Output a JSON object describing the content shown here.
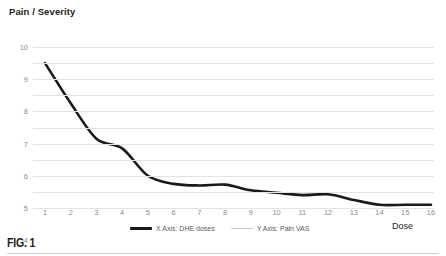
{
  "figure": {
    "caption": "FIG. 1"
  },
  "chart_data": {
    "type": "line",
    "title": "Pain / Severity",
    "xlabel": "Dose",
    "ylabel": "",
    "categories": [
      1,
      2,
      3,
      4,
      5,
      6,
      7,
      8,
      9,
      10,
      11,
      12,
      13,
      14,
      15,
      16
    ],
    "x_tick_labels": [
      "1",
      "2",
      "3",
      "4",
      "5",
      "6",
      "7",
      "8",
      "9",
      "10",
      "11",
      "12",
      "13",
      "14",
      "15",
      "16"
    ],
    "y_tick_labels": [
      "0",
      "1",
      "2",
      "3",
      "4",
      "5",
      "6",
      "7",
      "8",
      "9",
      "10"
    ],
    "values": [
      9.0,
      6.5,
      4.3,
      3.7,
      2.0,
      1.5,
      1.4,
      1.45,
      1.1,
      0.95,
      0.8,
      0.85,
      0.5,
      0.2,
      0.2,
      0.2
    ],
    "series": [
      {
        "name": "X Axis: DHE doses",
        "color": "#1a1a1a",
        "values": [
          9.0,
          6.5,
          4.3,
          3.7,
          2.0,
          1.5,
          1.4,
          1.45,
          1.1,
          0.95,
          0.8,
          0.85,
          0.5,
          0.2,
          0.2,
          0.2
        ]
      }
    ],
    "xlim": [
      1,
      16
    ],
    "ylim": [
      0,
      10
    ],
    "grid": true,
    "grid_color": "#e3e3e3",
    "legend_position": "bottom",
    "legend": [
      {
        "label": "X Axis: DHE doses",
        "color": "#1a1a1a",
        "style": "thick"
      },
      {
        "label": "Y Axis: Pain VAS",
        "color": "#c9c9c9",
        "style": "thin"
      }
    ]
  }
}
